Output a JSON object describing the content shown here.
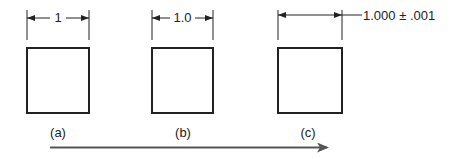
{
  "figures": [
    {
      "id": "a",
      "dimension": "1",
      "caption": "(a)"
    },
    {
      "id": "b",
      "dimension": "1.0",
      "caption": "(b)"
    },
    {
      "id": "c",
      "dimension": "1.000 ± .001",
      "caption": "(c)"
    }
  ],
  "colors": {
    "line": "#222222",
    "arrow": "#555555"
  }
}
